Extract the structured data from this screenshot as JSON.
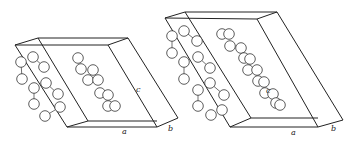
{
  "figure": {
    "cells": [
      {
        "id": "left",
        "labels": {
          "a": "a",
          "b": "b",
          "c": "c"
        },
        "edges": [
          [
            15,
            45,
            38,
            38
          ],
          [
            38,
            38,
            128,
            38
          ],
          [
            15,
            45,
            108,
            45
          ],
          [
            108,
            45,
            128,
            38
          ],
          [
            15,
            45,
            67,
            127
          ],
          [
            67,
            127,
            157,
            127
          ],
          [
            108,
            45,
            157,
            127
          ],
          [
            128,
            38,
            178,
            118
          ],
          [
            157,
            127,
            178,
            118
          ],
          [
            67,
            127,
            88,
            121
          ],
          [
            88,
            121,
            157,
            121
          ],
          [
            38,
            38,
            88,
            121
          ]
        ],
        "label_pos": {
          "c": [
            136,
            92
          ],
          "a": [
            122,
            134
          ],
          "b": [
            168,
            131
          ]
        },
        "atoms": [
          [
            21,
            62
          ],
          [
            33,
            57
          ],
          [
            44,
            67
          ],
          [
            22,
            79
          ],
          [
            46,
            83
          ],
          [
            34,
            88
          ],
          [
            58,
            94
          ],
          [
            34,
            104
          ],
          [
            60,
            107
          ],
          [
            45,
            116
          ],
          [
            78,
            58
          ],
          [
            81,
            69
          ],
          [
            93,
            70
          ],
          [
            88,
            80
          ],
          [
            98,
            80
          ],
          [
            100,
            93
          ],
          [
            108,
            95
          ],
          [
            108,
            106
          ],
          [
            115,
            106
          ]
        ],
        "bonds": [
          [
            21,
            62,
            22,
            79
          ],
          [
            33,
            57,
            44,
            67
          ],
          [
            34,
            88,
            34,
            104
          ],
          [
            46,
            83,
            58,
            94
          ],
          [
            60,
            107,
            45,
            116
          ]
        ]
      },
      {
        "id": "right",
        "labels": {
          "a": "a",
          "b": "b",
          "c": "c"
        },
        "edges": [
          [
            165,
            18,
            185,
            12
          ],
          [
            185,
            12,
            277,
            12
          ],
          [
            165,
            18,
            257,
            19
          ],
          [
            257,
            19,
            277,
            12
          ],
          [
            165,
            18,
            230,
            127
          ],
          [
            230,
            127,
            318,
            127
          ],
          [
            257,
            19,
            318,
            127
          ],
          [
            277,
            12,
            343,
            120
          ],
          [
            318,
            127,
            343,
            120
          ],
          [
            230,
            127,
            251,
            118
          ],
          [
            251,
            118,
            318,
            118
          ],
          [
            185,
            12,
            251,
            118
          ]
        ],
        "label_pos": {
          "c": [
            266,
            93
          ],
          "a": [
            291,
            135
          ],
          "b": [
            331,
            131
          ]
        },
        "atoms": [
          [
            172,
            36
          ],
          [
            184,
            31
          ],
          [
            197,
            41
          ],
          [
            172,
            53
          ],
          [
            198,
            57
          ],
          [
            184,
            62
          ],
          [
            210,
            68
          ],
          [
            184,
            79
          ],
          [
            210,
            83
          ],
          [
            198,
            90
          ],
          [
            224,
            95
          ],
          [
            198,
            106
          ],
          [
            222,
            110
          ],
          [
            211,
            115
          ],
          [
            222,
            34
          ],
          [
            229,
            34
          ],
          [
            230,
            46
          ],
          [
            241,
            48
          ],
          [
            244,
            58
          ],
          [
            250,
            59
          ],
          [
            248,
            70
          ],
          [
            257,
            70
          ],
          [
            258,
            81
          ],
          [
            264,
            82
          ],
          [
            265,
            93
          ],
          [
            273,
            94
          ],
          [
            276,
            103
          ],
          [
            280,
            105
          ]
        ],
        "bonds": [
          [
            172,
            36,
            172,
            53
          ],
          [
            184,
            62,
            184,
            79
          ],
          [
            198,
            90,
            198,
            106
          ],
          [
            184,
            31,
            197,
            41
          ],
          [
            198,
            57,
            210,
            68
          ],
          [
            210,
            83,
            224,
            95
          ]
        ]
      }
    ]
  }
}
